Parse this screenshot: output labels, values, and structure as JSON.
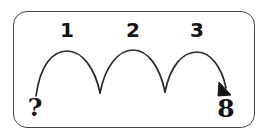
{
  "diagram": {
    "type": "number-line-hop-diagram",
    "title": "",
    "frame": {
      "shape": "rounded-rectangle",
      "border_color": "#45474a",
      "background_color": "#ffffff",
      "corner_radius_px": 14
    },
    "stroke_color": "#2b2b2b",
    "text_color": "#141414",
    "start_label": "?",
    "end_label": "8",
    "hops": [
      {
        "label": "1"
      },
      {
        "label": "2"
      },
      {
        "label": "3"
      }
    ],
    "arrow": {
      "head": "filled-triangle",
      "direction": "down-right",
      "points_to": "8"
    },
    "hop_count": 3,
    "direction": "left-to-right"
  },
  "icons": {
    "arc_hop": "arc-hop-icon",
    "arrowhead": "arrowhead-icon",
    "question": "question-mark-icon"
  }
}
